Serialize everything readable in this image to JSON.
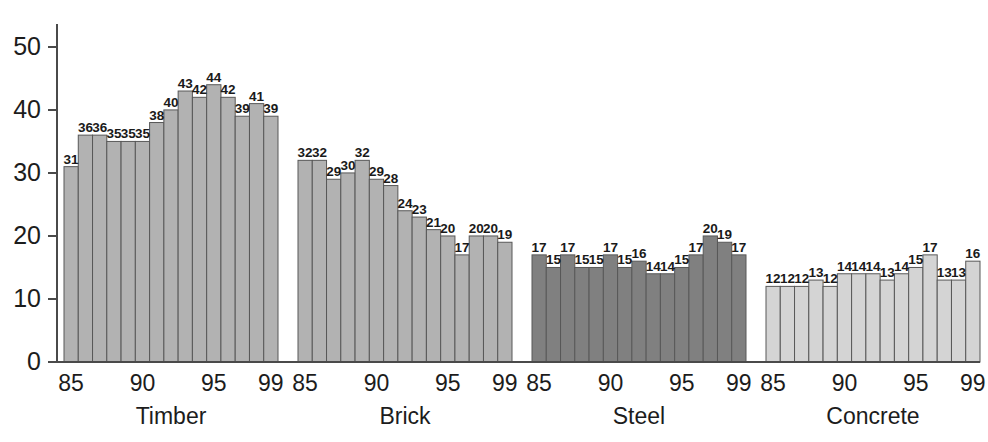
{
  "chart_data": {
    "type": "bar",
    "title": "",
    "subtitle": "",
    "xlabel": "",
    "ylabel": "",
    "ylim": [
      0,
      53
    ],
    "y_ticks": [
      0,
      10,
      20,
      30,
      40,
      50
    ],
    "y_tick_labels": [
      "0",
      "10",
      "20",
      "30",
      "40",
      "50"
    ],
    "grid": false,
    "legend_position": "none",
    "x_categories": [
      "85",
      "86",
      "87",
      "88",
      "89",
      "90",
      "91",
      "92",
      "93",
      "94",
      "95",
      "96",
      "97",
      "98",
      "99"
    ],
    "x_tick_labels_shown": [
      "85",
      "90",
      "95",
      "99"
    ],
    "x_tick_label_indices": [
      0,
      5,
      10,
      14
    ],
    "groups": [
      {
        "name": "Timber",
        "color": "#b2b2b2",
        "values": [
          31,
          36,
          36,
          35,
          35,
          35,
          38,
          40,
          43,
          42,
          44,
          42,
          39,
          41,
          39
        ]
      },
      {
        "name": "Brick",
        "color": "#b2b2b2",
        "values": [
          32,
          32,
          29,
          30,
          32,
          29,
          28,
          24,
          23,
          21,
          20,
          17,
          20,
          20,
          19
        ]
      },
      {
        "name": "Steel",
        "color": "#808080",
        "values": [
          17,
          15,
          17,
          15,
          15,
          17,
          15,
          16,
          14,
          14,
          15,
          17,
          20,
          19,
          17
        ]
      },
      {
        "name": "Concrete",
        "color": "#d4d4d4",
        "values": [
          12,
          12,
          12,
          13,
          12,
          14,
          14,
          14,
          13,
          14,
          15,
          17,
          13,
          13,
          16
        ]
      }
    ]
  },
  "axis": {
    "y_axis_name": "y-axis",
    "x_axis_name": "x-axis"
  }
}
